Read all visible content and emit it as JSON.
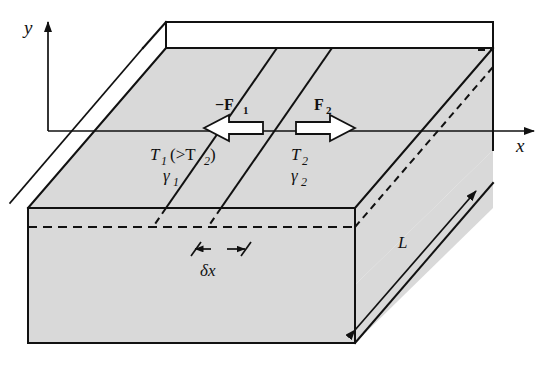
{
  "figure": {
    "type": "physics-diagram",
    "background_color": "#ffffff",
    "line_color": "#111111",
    "slab_fill_color": "#d9d9d9",
    "top_face_color": "#ffffff"
  },
  "axes": {
    "y_label": "y",
    "x_label": "x",
    "origin_x": 48,
    "origin_y": 131,
    "y_tip_y": 18,
    "x_tip_x": 540
  },
  "labels": {
    "force_left": "−F",
    "force_left_sub": "1",
    "force_right": "F",
    "force_right_sub": "2",
    "temp_left": "T",
    "temp_left_sub": "1",
    "temp_compare": "(>T",
    "temp_compare_sub": "2",
    "temp_compare_close": ")",
    "gamma_left": "γ",
    "gamma_left_sub": "1",
    "temp_right": "T",
    "temp_right_sub": "2",
    "gamma_right": "γ",
    "gamma_right_sub": "2",
    "depth": "L",
    "delta_x": "δx"
  },
  "geometry": {
    "front_top_left_x": 28,
    "front_top_left_y": 208,
    "front_bottom_left_y": 343,
    "front_right_x": 355,
    "front_right_top_y": 208,
    "back_top_left_x": 166,
    "back_top_left_y": 48,
    "back_top_right_x": 493,
    "back_top_right_y": 48,
    "top_strip_y": 22,
    "hidden_line_y": 227,
    "slant_line_1_top_x": 277,
    "slant_line_2_top_x": 332,
    "slant_line_slope_dx": -111,
    "slant_line_slope_dy": 160,
    "delta_x_left": 196,
    "delta_x_right": 246,
    "delta_x_y": 249
  }
}
